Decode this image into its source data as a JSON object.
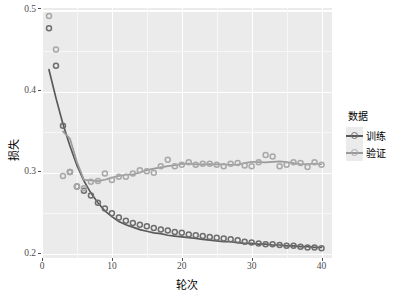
{
  "chart_data": {
    "type": "scatter",
    "title": "",
    "xlabel": "轮次",
    "ylabel": "损失",
    "xlim": [
      0,
      41.5
    ],
    "ylim": [
      0.195,
      0.503
    ],
    "xticks": [
      0,
      10,
      20,
      30,
      40
    ],
    "xtick_labels": [
      "0",
      "10",
      "20",
      "30",
      "40"
    ],
    "yticks": [
      0.2,
      0.3,
      0.4,
      0.5
    ],
    "ytick_labels": [
      "0.2",
      "0.3",
      "0.4",
      "0.5"
    ],
    "grid": true,
    "grid_major_color": "#ffffff",
    "grid_minor_color": "#f7f7f7",
    "panel_background": "#ebebeb",
    "legend_position": "right",
    "legend_title": "数据",
    "x": [
      1,
      2,
      3,
      4,
      5,
      6,
      7,
      8,
      9,
      10,
      11,
      12,
      13,
      14,
      15,
      16,
      17,
      18,
      19,
      20,
      21,
      22,
      23,
      24,
      25,
      26,
      27,
      28,
      29,
      30,
      31,
      32,
      33,
      34,
      35,
      36,
      37,
      38,
      39,
      40
    ],
    "series": [
      {
        "name": "训练",
        "color": "#6e6e6e",
        "point_color": "#6e6e6e",
        "line_color": "#5a5a5a",
        "has_smooth_line": true,
        "values": [
          0.478,
          0.432,
          0.358,
          0.301,
          0.283,
          0.278,
          0.272,
          0.263,
          0.256,
          0.25,
          0.245,
          0.241,
          0.238,
          0.236,
          0.234,
          0.232,
          0.23,
          0.229,
          0.227,
          0.226,
          0.224,
          0.223,
          0.222,
          0.221,
          0.22,
          0.219,
          0.218,
          0.217,
          0.215,
          0.214,
          0.213,
          0.212,
          0.212,
          0.211,
          0.21,
          0.21,
          0.209,
          0.208,
          0.208,
          0.207
        ],
        "smooth": [
          0.427,
          0.392,
          0.36,
          0.333,
          0.309,
          0.29,
          0.275,
          0.263,
          0.253,
          0.246,
          0.24,
          0.236,
          0.233,
          0.23,
          0.228,
          0.226,
          0.225,
          0.223,
          0.222,
          0.221,
          0.22,
          0.219,
          0.218,
          0.217,
          0.216,
          0.215,
          0.215,
          0.214,
          0.213,
          0.213,
          0.212,
          0.212,
          0.211,
          0.211,
          0.21,
          0.21,
          0.209,
          0.209,
          0.208,
          0.208
        ]
      },
      {
        "name": "验证",
        "color": "#a8a8a8",
        "point_color": "#a8a8a8",
        "line_color": "#9a9a9a",
        "has_smooth_line": true,
        "values": [
          0.493,
          0.452,
          0.296,
          0.301,
          0.283,
          0.281,
          0.289,
          0.29,
          0.299,
          0.291,
          0.295,
          0.295,
          0.299,
          0.303,
          0.302,
          0.3,
          0.308,
          0.316,
          0.308,
          0.31,
          0.313,
          0.31,
          0.311,
          0.311,
          0.31,
          0.308,
          0.311,
          0.312,
          0.309,
          0.308,
          0.313,
          0.322,
          0.32,
          0.308,
          0.31,
          0.313,
          0.312,
          0.307,
          0.313,
          0.31
        ]
      }
    ]
  }
}
